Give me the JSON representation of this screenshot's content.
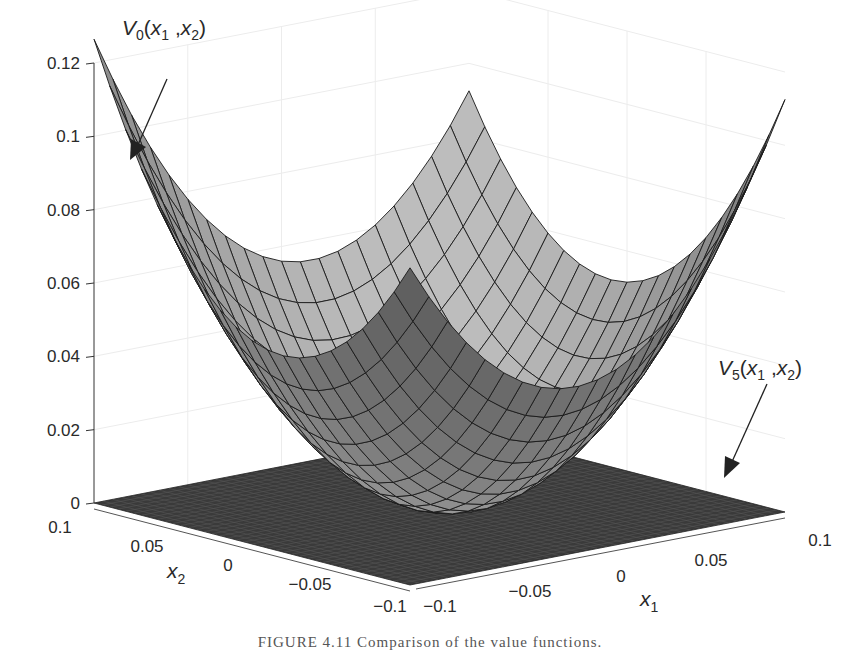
{
  "figure": {
    "caption": "FIGURE 4.11   Comparison of the value functions."
  },
  "chart_data": {
    "type": "surface3d",
    "title": "",
    "xlabel": "x1",
    "ylabel": "x2",
    "zlabel": "",
    "xlim": [
      -0.1,
      0.1
    ],
    "ylim": [
      -0.1,
      0.1
    ],
    "zlim": [
      0,
      0.12
    ],
    "x_ticks": [
      "-0.1",
      "-0.05",
      "0",
      "0.05",
      "0.1"
    ],
    "y_ticks": [
      "-0.1",
      "-0.05",
      "0",
      "0.05",
      "0.1"
    ],
    "z_ticks": [
      "0",
      "0.02",
      "0.04",
      "0.06",
      "0.08",
      "0.1",
      "0.12"
    ],
    "grid": true,
    "series": [
      {
        "name": "V0(x1 ,x2)",
        "kind": "quadratic surface (bowl)",
        "mesh": 21,
        "corner_values": {
          "x1=-0.1,x2=0.1": 0.117,
          "x1=0.1,x2=0.1": 0.087,
          "x1=0.1,x2=-0.1": 0.107,
          "x1=-0.1,x2=-0.1": 0.1
        },
        "minimum": {
          "x1": 0,
          "x2": 0,
          "z": 0
        },
        "color": "#8e8e8e"
      },
      {
        "name": "V5(x1 ,x2)",
        "kind": "near-zero flat surface",
        "mesh": 41,
        "value": 0,
        "color": "#3a3a3a"
      }
    ],
    "annotations": [
      {
        "text": "V0(x1 ,x2)",
        "points_to": "V0 surface corner near x1=-0.1, x2=0.1"
      },
      {
        "text": "V5(x1 ,x2)",
        "points_to": "flat V5 surface at z=0"
      }
    ]
  },
  "labels": {
    "v0": {
      "main": "V",
      "sub": "0",
      "args_a": "(x",
      "args_a_sub": "1",
      "args_b": " ,x",
      "args_b_sub": "2",
      "close": ")"
    },
    "v5": {
      "main": "V",
      "sub": "5",
      "args_a": "(x",
      "args_a_sub": "1",
      "args_b": " ,x",
      "args_b_sub": "2",
      "close": ")"
    },
    "x1_axis": {
      "main": "x",
      "sub": "1"
    },
    "x2_axis": {
      "main": "x",
      "sub": "2"
    }
  },
  "colors": {
    "surface_base": "#8e8e8e",
    "flat_surface": "#3a3a3a",
    "mesh_line": "#1a1a1a",
    "axis": "#333333"
  }
}
